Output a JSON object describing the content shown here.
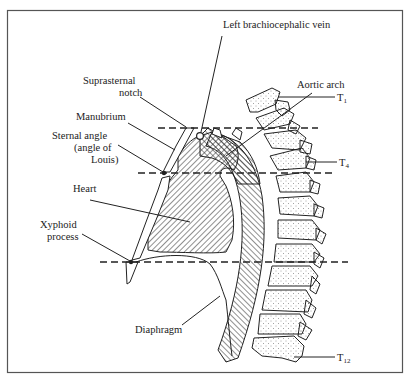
{
  "figure": {
    "type": "anatomical-diagram",
    "view": "sagittal section of thorax"
  },
  "labels": {
    "left_brachiocephalic_vein": "Left brachiocephalic vein",
    "suprasternal_notch_1": "Suprasternal",
    "suprasternal_notch_2": "notch",
    "manubrium": "Manubrium",
    "sternal_angle_1": "Sternal angle",
    "sternal_angle_2": "(angle of",
    "sternal_angle_3": "Louis)",
    "heart": "Heart",
    "xyphoid_1": "Xyphoid",
    "xyphoid_2": "process",
    "diaphragm": "Diaphragm",
    "aortic_arch": "Aortic arch"
  },
  "vertebra_labels": {
    "t1": {
      "letter": "T",
      "sub": "1"
    },
    "t4": {
      "letter": "T",
      "sub": "4"
    },
    "t12": {
      "letter": "T",
      "sub": "12"
    }
  },
  "reference_lines": [
    {
      "name": "suprasternal-notch-level",
      "vertebral_level": "T2/T3"
    },
    {
      "name": "sternal-angle-level",
      "vertebral_level": "T4/T5"
    },
    {
      "name": "xyphoid-level",
      "vertebral_level": "T9"
    }
  ],
  "colors": {
    "ink": "#222222",
    "frame": "#555555",
    "background": "#ffffff"
  }
}
